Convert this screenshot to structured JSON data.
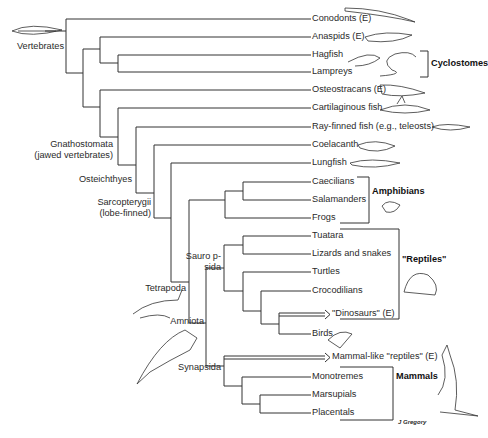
{
  "diagram": {
    "type": "phylogenetic-tree",
    "leaves": [
      {
        "name": "Conodonts (E)",
        "y": 19
      },
      {
        "name": "Anaspids (E)",
        "y": 37
      },
      {
        "name": "Hagfish",
        "y": 55
      },
      {
        "name": "Lampreys",
        "y": 72
      },
      {
        "name": "Osteostracans (E)",
        "y": 90
      },
      {
        "name": "Cartilaginous fish",
        "y": 108
      },
      {
        "name": "Ray-finned fish (e.g., teleosts)",
        "y": 127
      },
      {
        "name": "Coelacanth",
        "y": 145
      },
      {
        "name": "Lungfish",
        "y": 163
      },
      {
        "name": "Caecilians",
        "y": 182
      },
      {
        "name": "Salamanders",
        "y": 200
      },
      {
        "name": "Frogs",
        "y": 218
      },
      {
        "name": "Tuatara",
        "y": 236
      },
      {
        "name": "Lizards and snakes",
        "y": 254
      },
      {
        "name": "Turtles",
        "y": 272
      },
      {
        "name": "Crocodilians",
        "y": 291
      },
      {
        "name": "\"Dinosaurs\" (E)",
        "y": 313
      },
      {
        "name": "Birds",
        "y": 334
      },
      {
        "name": "Mammal-like \"reptiles\" (E)",
        "y": 356
      },
      {
        "name": "Monotremes",
        "y": 377
      },
      {
        "name": "Marsupials",
        "y": 395
      },
      {
        "name": "Placentals",
        "y": 413
      }
    ],
    "clade_labels": {
      "vertebrates": "Vertebrates",
      "gnathostomata_1": "Gnathostomata",
      "gnathostomata_2": "(jawed vertebrates)",
      "osteichthyes": "Osteichthyes",
      "sarcopterygii_1": "Sarcopterygii",
      "sarcopterygii_2": "(lobe-finned)",
      "sauropsida_1": "Sauro p-",
      "sauropsida_2": "sida",
      "tetrapoda": "Tetrapoda",
      "amniota": "Amniota",
      "synapsida": "Synapsida"
    },
    "group_brackets": {
      "cyclostomes": "Cyclostomes",
      "amphibians": "Amphibians",
      "reptiles": "\"Reptiles\"",
      "mammals": "Mammals"
    },
    "signature": "J Gregory",
    "note": "(E) = extinct",
    "line_color": "#333333"
  }
}
